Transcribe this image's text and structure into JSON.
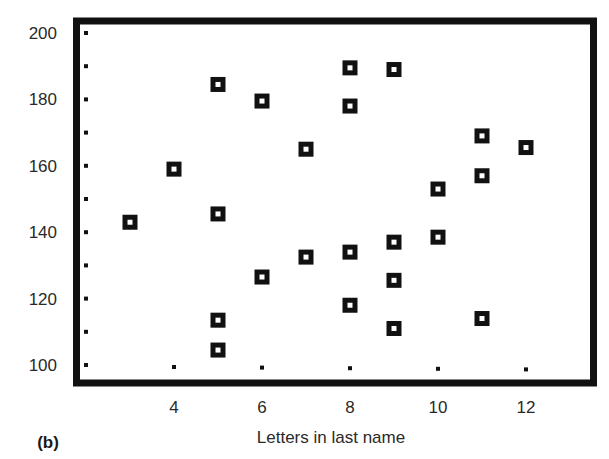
{
  "chart_data": {
    "type": "scatter",
    "title": "",
    "panel_label": "(b)",
    "xlabel": "Letters in last name",
    "ylabel": "",
    "xlim": [
      2,
      13
    ],
    "ylim": [
      100,
      200
    ],
    "x_ticks": [
      4,
      6,
      8,
      10,
      12
    ],
    "y_ticks": [
      100,
      120,
      140,
      160,
      180,
      200
    ],
    "grid": false,
    "legend": null,
    "marker": "hollow-square",
    "series": [
      {
        "name": "data",
        "points": [
          {
            "x": 3,
            "y": 143
          },
          {
            "x": 4,
            "y": 159
          },
          {
            "x": 5,
            "y": 184.5
          },
          {
            "x": 5,
            "y": 145.5
          },
          {
            "x": 5,
            "y": 113.5
          },
          {
            "x": 5,
            "y": 104.5
          },
          {
            "x": 6,
            "y": 179.5
          },
          {
            "x": 6,
            "y": 126.5
          },
          {
            "x": 7,
            "y": 165
          },
          {
            "x": 7,
            "y": 132.5
          },
          {
            "x": 8,
            "y": 189.5
          },
          {
            "x": 8,
            "y": 178
          },
          {
            "x": 8,
            "y": 134
          },
          {
            "x": 8,
            "y": 118
          },
          {
            "x": 9,
            "y": 189
          },
          {
            "x": 9,
            "y": 137
          },
          {
            "x": 9,
            "y": 125.5
          },
          {
            "x": 9,
            "y": 111
          },
          {
            "x": 10,
            "y": 153
          },
          {
            "x": 10,
            "y": 138.5
          },
          {
            "x": 11,
            "y": 169
          },
          {
            "x": 11,
            "y": 157
          },
          {
            "x": 11,
            "y": 114
          },
          {
            "x": 12,
            "y": 165.5
          }
        ]
      }
    ],
    "colors": {
      "frame": "#111111",
      "marker": "#111111",
      "text": "#2a2a2a",
      "background": "#ffffff"
    }
  }
}
